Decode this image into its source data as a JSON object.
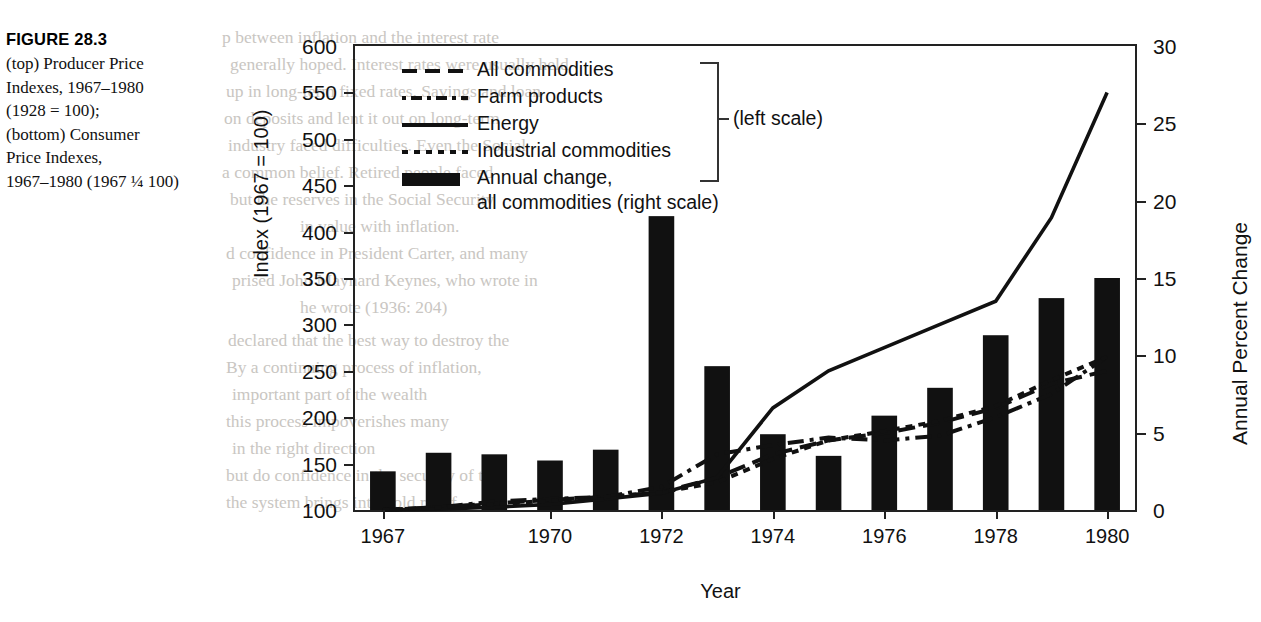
{
  "figure": {
    "label": "FIGURE 28.3",
    "caption_lines": [
      "(top) Producer Price",
      "Indexes, 1967–1980",
      "(1928 = 100);",
      "(bottom) Consumer",
      "Price Indexes,",
      "1967–1980 (1967 ¼ 100)"
    ]
  },
  "chart_data": {
    "type": "line",
    "title": "",
    "xlabel": "Year",
    "ylabel": "Index (1967 = 100)",
    "y2label": "Annual Percent Change",
    "ylim": [
      100,
      600
    ],
    "y2lim": [
      0,
      30
    ],
    "yticks": [
      100,
      150,
      200,
      250,
      300,
      350,
      400,
      450,
      500,
      550,
      600
    ],
    "y2ticks": [
      0,
      5,
      10,
      15,
      20,
      25,
      30
    ],
    "x": [
      1967,
      1968,
      1969,
      1970,
      1971,
      1972,
      1973,
      1974,
      1975,
      1976,
      1977,
      1978,
      1979,
      1980
    ],
    "xticks": [
      1967,
      1970,
      1972,
      1974,
      1976,
      1978,
      1980
    ],
    "xtick_labels": [
      "1967",
      "1970",
      "1972",
      "1974",
      "1976",
      "1978",
      "1980"
    ],
    "grid": false,
    "legend_position": "top-left",
    "series": [
      {
        "name": "All commodities",
        "style": "dashed",
        "axis": "left",
        "values": [
          100,
          103,
          107,
          111,
          114,
          119,
          135,
          160,
          175,
          183,
          194,
          210,
          236,
          250
        ]
      },
      {
        "name": "Farm products",
        "style": "dash-dot",
        "axis": "left",
        "values": [
          100,
          103,
          109,
          112,
          114,
          125,
          160,
          170,
          178,
          175,
          180,
          200,
          225,
          265
        ]
      },
      {
        "name": "Energy",
        "style": "solid",
        "axis": "left",
        "values": [
          100,
          101,
          103,
          106,
          112,
          118,
          135,
          210,
          250,
          275,
          300,
          325,
          415,
          550
        ]
      },
      {
        "name": "Industrial commodities",
        "style": "dotted",
        "axis": "left",
        "values": [
          100,
          103,
          106,
          110,
          114,
          119,
          130,
          155,
          175,
          185,
          196,
          212,
          240,
          265
        ]
      },
      {
        "name": "Annual change, all commodities (right scale)",
        "style": "bar",
        "axis": "right",
        "values": [
          2.5,
          3.7,
          3.6,
          3.2,
          3.9,
          19.0,
          9.3,
          4.9,
          3.5,
          6.1,
          7.9,
          11.3,
          13.7,
          15.0
        ]
      }
    ]
  },
  "legend": {
    "entries": [
      {
        "label": "All commodities",
        "key": "dashed-line-key"
      },
      {
        "label": "Farm products",
        "key": "dash-dot-line-key"
      },
      {
        "label": "Energy",
        "key": "solid-line-key"
      },
      {
        "label": "Industrial commodities",
        "key": "dotted-line-key"
      }
    ],
    "bar_entry": {
      "label_line1": "Annual change,",
      "label_line2": "all commodities (right scale)",
      "key": "black-bar-key"
    },
    "scale_note": "(left scale)"
  },
  "ghost_text": {
    "lines": [
      "p between inflation and the interest rate",
      "generally hoped. Interest rates were usually held",
      "up in long-term fixed rates. Savings and loan",
      "on deposits and lent it out on long-term",
      "industry faced difficulties. Even the Social",
      "a common belief. Retired people faced",
      "but the reserves in the Social Security",
      "in value with inflation.",
      "d confidence in President Carter, and many",
      "prised John Maynard Keynes, who wrote in",
      "he wrote (1936: 204)",
      "declared that the best way to destroy the",
      "By a continuing process of inflation,",
      "important part of the wealth",
      "this process impoverishes many",
      "in the right direction",
      "but do confidence in the security of the",
      "the system brings into bold relief"
    ]
  }
}
